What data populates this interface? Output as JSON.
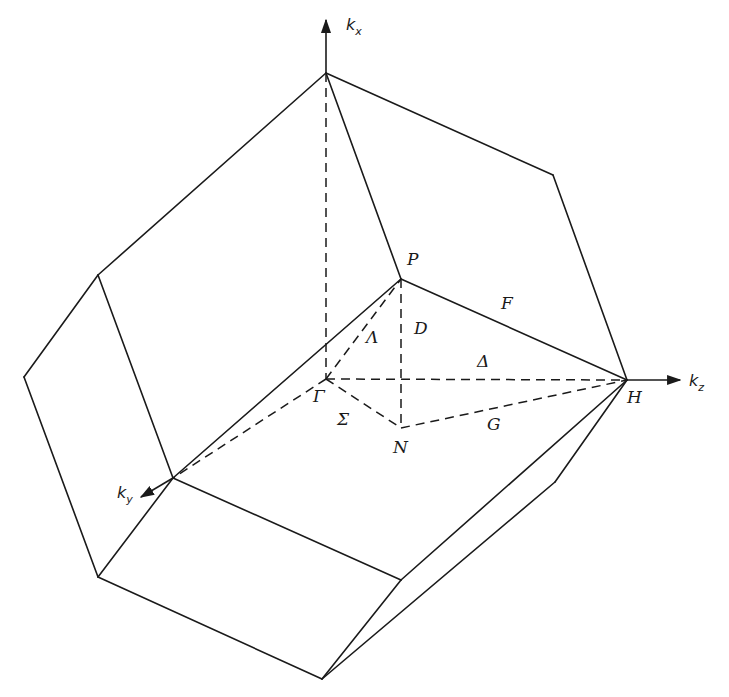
{
  "figure": {
    "stroke_color": "#1a1a1a",
    "background_color": "#ffffff"
  },
  "axes": {
    "kx": {
      "base": "k",
      "sub": "x"
    },
    "ky": {
      "base": "k",
      "sub": "y"
    },
    "kz": {
      "base": "k",
      "sub": "z"
    }
  },
  "points": {
    "gamma": "Γ",
    "P": "P",
    "H": "H",
    "N": "N"
  },
  "lines": {
    "Lambda": "Λ",
    "Delta": "Δ",
    "Sigma": "Σ",
    "D": "D",
    "F": "F",
    "G": "G"
  }
}
